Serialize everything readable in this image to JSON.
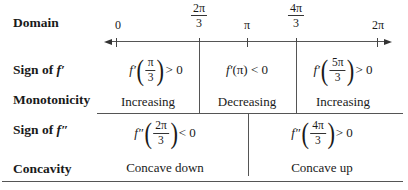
{
  "row_labels": {
    "domain": "Domain",
    "sign_f1_prefix": "Sign of ",
    "sign_f1_fn": "f′",
    "monotonicity": "Monotonicity",
    "sign_f2_prefix": "Sign of ",
    "sign_f2_fn": "f″",
    "concavity": "Concavity"
  },
  "axis": {
    "ticks": [
      {
        "label": "0",
        "x": 116
      },
      {
        "num": "2π",
        "den": "3",
        "x": 199
      },
      {
        "label": "π",
        "x": 247
      },
      {
        "num": "4π",
        "den": "3",
        "x": 296
      },
      {
        "label": "2π",
        "x": 377
      }
    ],
    "t0": "0",
    "t1_num": "2π",
    "t1_den": "3",
    "t2": "π",
    "t3_num": "4π",
    "t3_den": "3",
    "t4": "2π"
  },
  "sign_f1": {
    "c1": {
      "fn": "f′",
      "num": "π",
      "den": "3",
      "rel": "> 0"
    },
    "c2": {
      "text": "f′(π) < 0",
      "fn": "f′",
      "arg": "(π)",
      "rel": "< 0"
    },
    "c3": {
      "fn": "f′",
      "num": "5π",
      "den": "3",
      "rel": "> 0"
    }
  },
  "monotonicity": {
    "c1": "Increasing",
    "c2": "Decreasing",
    "c3": "Increasing"
  },
  "sign_f2": {
    "c1": {
      "fn": "f″",
      "num": "2π",
      "den": "3",
      "rel": "< 0"
    },
    "c2": {
      "fn": "f″",
      "num": "4π",
      "den": "3",
      "rel": "> 0"
    }
  },
  "concavity": {
    "c1": "Concave down",
    "c2": "Concave up"
  }
}
